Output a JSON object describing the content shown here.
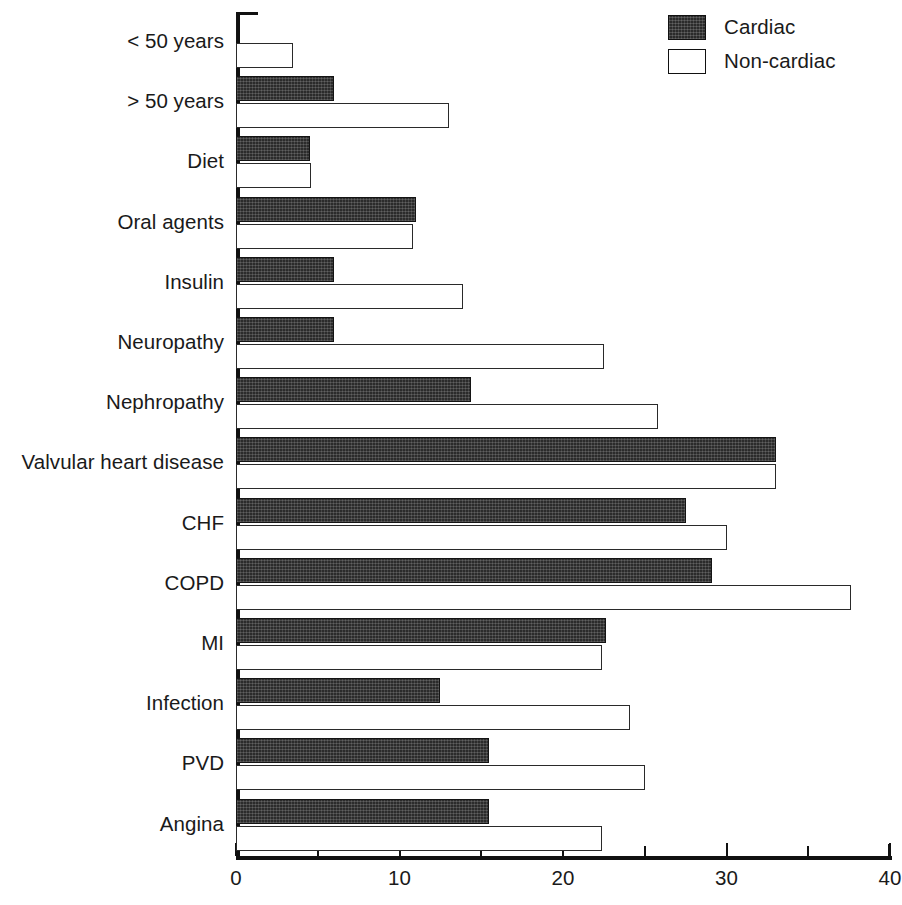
{
  "legend": {
    "position": "top-right",
    "items": [
      {
        "label": "Cardiac",
        "swatch": "filled-dark",
        "color": "#2b2b2b"
      },
      {
        "label": "Non-cardiac",
        "swatch": "outline-white",
        "color": "#ffffff"
      }
    ]
  },
  "axis": {
    "x_ticks_major": [
      "0",
      "10",
      "20",
      "30",
      "40"
    ],
    "x_ticks_minor": [
      5,
      15,
      25,
      35
    ],
    "x_min": 0,
    "x_max": 40
  },
  "chart_data": {
    "type": "bar",
    "orientation": "horizontal",
    "grouped": true,
    "title": "",
    "subtitle": "",
    "xlabel": "",
    "ylabel": "",
    "xlim": [
      0,
      40
    ],
    "grid": false,
    "legend_position": "top-right",
    "categories": [
      "< 50 years",
      "> 50 years",
      "Diet",
      "Oral agents",
      "Insulin",
      "Neuropathy",
      "Nephropathy",
      "Valvular heart disease",
      "CHF",
      "COPD",
      "MI",
      "Infection",
      "PVD",
      "Angina"
    ],
    "series": [
      {
        "name": "Cardiac",
        "color": "#2b2b2b",
        "values": [
          0,
          6.0,
          4.5,
          11.0,
          6.0,
          6.0,
          14.4,
          33.0,
          27.5,
          29.1,
          22.6,
          12.5,
          15.5,
          15.5
        ]
      },
      {
        "name": "Non-cardiac",
        "color": "#ffffff",
        "values": [
          3.5,
          13.0,
          4.6,
          10.8,
          13.9,
          22.5,
          25.8,
          33.0,
          30.0,
          37.6,
          22.4,
          24.1,
          25.0,
          22.4
        ]
      }
    ]
  }
}
